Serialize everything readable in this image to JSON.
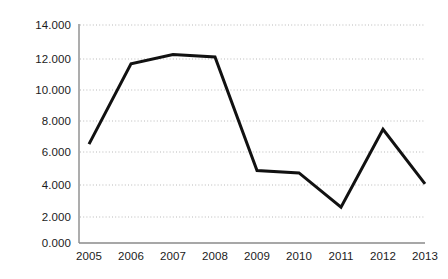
{
  "chart_data": {
    "type": "line",
    "title": "",
    "subtitle": "",
    "xlabel": "",
    "ylabel": "",
    "x": [
      "2005",
      "2006",
      "2007",
      "2008",
      "2009",
      "2010",
      "2011",
      "2012",
      "2013"
    ],
    "categories": [
      "2005",
      "2006",
      "2007",
      "2008",
      "2009",
      "2010",
      "2011",
      "2012",
      "2013"
    ],
    "values": [
      6.35,
      11.5,
      12.1,
      11.95,
      4.65,
      4.5,
      2.3,
      7.3,
      3.8
    ],
    "series": [
      {
        "name": "",
        "values": [
          6.35,
          11.5,
          12.1,
          11.95,
          4.65,
          4.5,
          2.3,
          7.3,
          3.8
        ]
      }
    ],
    "ylim": [
      0,
      14
    ],
    "ytick_values": [
      0,
      2,
      4,
      6,
      8,
      10,
      12,
      14
    ],
    "ytick_labels": [
      "0.000",
      "2.000",
      "4.000",
      "6.000",
      "8.000",
      "10.000",
      "12.000",
      "14.000"
    ],
    "xtick_labels": [
      "2005",
      "2006",
      "2007",
      "2008",
      "2009",
      "2010",
      "2011",
      "2012",
      "2013"
    ],
    "grid": true,
    "grid_style": "dotted-horizontal",
    "legend": "none",
    "annotations": [],
    "colors": {
      "line": "#111111",
      "grid": "#b9b9b9",
      "axis": "#8a8a8a",
      "text": "#1b1b1b",
      "background": "#ffffff"
    },
    "line_width": 3
  }
}
